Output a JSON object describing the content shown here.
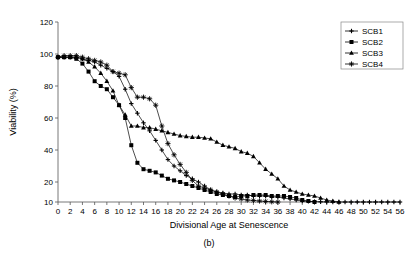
{
  "figure": {
    "caption": "(b)"
  },
  "chart_data": {
    "type": "line",
    "title": "",
    "subtitle": "",
    "xlabel": "Divisional Age at Senescence",
    "ylabel": "Viability (%)",
    "xlim": [
      0,
      56
    ],
    "ylim": [
      10,
      120
    ],
    "grid": false,
    "legend_position": "top-right",
    "xticks": [
      0,
      2,
      4,
      6,
      8,
      10,
      12,
      14,
      16,
      18,
      20,
      22,
      24,
      26,
      28,
      30,
      32,
      34,
      36,
      38,
      40,
      42,
      44,
      46,
      48,
      50,
      52,
      54,
      56
    ],
    "yticks": [
      10,
      20,
      40,
      60,
      80,
      100,
      120
    ],
    "annotations": [],
    "series": [
      {
        "name": "SCB1",
        "marker": "cross",
        "x": [
          0,
          1,
          2,
          3,
          4,
          5,
          6,
          7,
          8,
          9,
          10,
          11,
          12,
          13,
          14,
          15,
          16,
          17,
          18,
          19,
          20,
          21,
          22,
          23,
          24,
          25,
          26,
          27,
          28,
          29,
          30,
          31,
          32,
          33,
          34,
          35,
          36,
          37,
          38,
          39,
          40,
          41,
          42,
          43,
          44,
          45,
          46,
          47,
          48,
          49,
          50,
          51,
          52,
          53,
          54,
          55,
          56
        ],
        "y": [
          98,
          98,
          98,
          98,
          97,
          96,
          95,
          93,
          91,
          89,
          86,
          78,
          69,
          63,
          57,
          52,
          46,
          40,
          34,
          30,
          27,
          24,
          22,
          20,
          18,
          16,
          15,
          14.5,
          14,
          14,
          13.5,
          13.5,
          13,
          13,
          13,
          12.5,
          12.5,
          12,
          11.5,
          11,
          10.5,
          10.3,
          10.2,
          10.1,
          10,
          10,
          10,
          10,
          10,
          10,
          10,
          10,
          10,
          10,
          10,
          10,
          10
        ]
      },
      {
        "name": "SCB2",
        "marker": "square",
        "x": [
          0,
          1,
          2,
          3,
          4,
          5,
          6,
          7,
          8,
          9,
          10,
          11,
          12,
          13,
          14,
          15,
          16,
          17,
          18,
          19,
          20,
          21,
          22,
          23,
          24,
          25,
          26,
          27,
          28,
          29,
          30,
          31,
          32,
          33,
          34,
          35,
          36,
          37,
          38,
          39,
          40,
          41,
          42
        ],
        "y": [
          98,
          98,
          98,
          97,
          94,
          89,
          83,
          80,
          78,
          73,
          68,
          60,
          43,
          32,
          28,
          27,
          26,
          24,
          22,
          21,
          20,
          19,
          18,
          17,
          16,
          15,
          14,
          13.5,
          13,
          12.5,
          13,
          13,
          13.5,
          13.5,
          13.5,
          13,
          13,
          13,
          12.5,
          12,
          11,
          10.5,
          10
        ]
      },
      {
        "name": "SCB3",
        "marker": "triangle",
        "x": [
          0,
          1,
          2,
          3,
          4,
          5,
          6,
          7,
          8,
          9,
          10,
          11,
          12,
          13,
          14,
          15,
          16,
          17,
          18,
          19,
          20,
          21,
          22,
          23,
          24,
          25,
          26,
          27,
          28,
          29,
          30,
          31,
          32,
          33,
          34,
          35,
          36,
          37,
          38,
          39,
          40,
          41,
          42,
          43,
          44,
          45,
          46
        ],
        "y": [
          98,
          98,
          98,
          98,
          97,
          95,
          92,
          88,
          83,
          77,
          68,
          62,
          55,
          55,
          54,
          54,
          53,
          52,
          51,
          50,
          49,
          48.5,
          48,
          48,
          47.5,
          47,
          45,
          43,
          42,
          41,
          39,
          38,
          36,
          32,
          28,
          25,
          22,
          18,
          16,
          15,
          14,
          13.5,
          13,
          12,
          11,
          10.5,
          10
        ]
      },
      {
        "name": "SCB4",
        "marker": "star",
        "x": [
          0,
          1,
          2,
          3,
          4,
          5,
          6,
          7,
          8,
          9,
          10,
          11,
          12,
          13,
          14,
          15,
          16,
          17,
          18,
          19,
          20,
          21,
          22,
          23,
          24,
          25,
          26,
          27,
          28,
          29,
          30,
          31,
          32,
          33,
          34,
          35,
          36
        ],
        "y": [
          98,
          99,
          99,
          99,
          98,
          97,
          96,
          95,
          93,
          89,
          88,
          87,
          79,
          73,
          73,
          72,
          68,
          55,
          44,
          37,
          31,
          26,
          21,
          18,
          17,
          16,
          15,
          14,
          13,
          12,
          11.5,
          11,
          10.8,
          10.5,
          10.3,
          10.1,
          10
        ]
      }
    ]
  }
}
